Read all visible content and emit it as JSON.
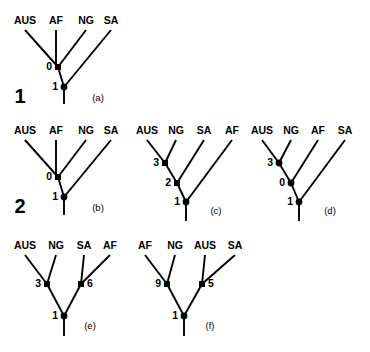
{
  "figure": {
    "background_color": "#ffffff",
    "ink_color": "#000000",
    "width": 370,
    "height": 352,
    "group_numbers": [
      {
        "text": "1",
        "x": 20,
        "y": 98
      },
      {
        "text": "2",
        "x": 20,
        "y": 208
      }
    ]
  },
  "trees": [
    {
      "id": "tree-a",
      "panel_label": "(a)",
      "panel_label_pos": {
        "x": 98,
        "y": 101
      },
      "taxa": [
        {
          "name": "AUS",
          "x": 25,
          "y": 24
        },
        {
          "name": "AF",
          "x": 56,
          "y": 24
        },
        {
          "name": "NG",
          "x": 86,
          "y": 24
        },
        {
          "name": "SA",
          "x": 111,
          "y": 24
        }
      ],
      "nodes": [
        {
          "label": "0",
          "x": 58,
          "y": 67,
          "shape": "square",
          "label_side": "left"
        },
        {
          "label": "1",
          "x": 64,
          "y": 87,
          "shape": "dot",
          "label_side": "left"
        }
      ],
      "branches": [
        [
          25,
          30,
          58,
          67
        ],
        [
          56,
          30,
          56,
          67
        ],
        [
          86,
          30,
          58,
          67
        ],
        [
          111,
          30,
          64,
          87
        ],
        [
          58,
          67,
          64,
          87
        ],
        [
          64,
          87,
          64,
          104
        ]
      ]
    },
    {
      "id": "tree-b",
      "panel_label": "(b)",
      "panel_label_pos": {
        "x": 98,
        "y": 211
      },
      "taxa": [
        {
          "name": "AUS",
          "x": 25,
          "y": 134
        },
        {
          "name": "AF",
          "x": 56,
          "y": 134
        },
        {
          "name": "NG",
          "x": 86,
          "y": 134
        },
        {
          "name": "SA",
          "x": 111,
          "y": 134
        }
      ],
      "nodes": [
        {
          "label": "0",
          "x": 58,
          "y": 177,
          "shape": "square",
          "label_side": "left"
        },
        {
          "label": "1",
          "x": 64,
          "y": 197,
          "shape": "dot",
          "label_side": "left"
        }
      ],
      "branches": [
        [
          25,
          140,
          58,
          177
        ],
        [
          56,
          140,
          56,
          177
        ],
        [
          86,
          140,
          58,
          177
        ],
        [
          111,
          140,
          64,
          197
        ],
        [
          58,
          177,
          64,
          197
        ],
        [
          64,
          197,
          64,
          215
        ]
      ]
    },
    {
      "id": "tree-c",
      "panel_label": "(c)",
      "panel_label_pos": {
        "x": 216,
        "y": 214
      },
      "taxa": [
        {
          "name": "AUS",
          "x": 147,
          "y": 134
        },
        {
          "name": "NG",
          "x": 176,
          "y": 134
        },
        {
          "name": "SA",
          "x": 204,
          "y": 134
        },
        {
          "name": "AF",
          "x": 232,
          "y": 134
        }
      ],
      "nodes": [
        {
          "label": "3",
          "x": 165,
          "y": 163,
          "shape": "square",
          "label_side": "left"
        },
        {
          "label": "2",
          "x": 177,
          "y": 183,
          "shape": "square",
          "label_side": "left"
        },
        {
          "label": "1",
          "x": 186,
          "y": 202,
          "shape": "dot",
          "label_side": "left"
        }
      ],
      "branches": [
        [
          147,
          140,
          165,
          163
        ],
        [
          176,
          140,
          165,
          163
        ],
        [
          204,
          140,
          177,
          183
        ],
        [
          232,
          140,
          186,
          202
        ],
        [
          165,
          163,
          177,
          183
        ],
        [
          177,
          183,
          186,
          202
        ],
        [
          186,
          202,
          186,
          221
        ]
      ]
    },
    {
      "id": "tree-d",
      "panel_label": "(d)",
      "panel_label_pos": {
        "x": 330,
        "y": 214
      },
      "taxa": [
        {
          "name": "AUS",
          "x": 262,
          "y": 134
        },
        {
          "name": "NG",
          "x": 291,
          "y": 134
        },
        {
          "name": "AF",
          "x": 318,
          "y": 134
        },
        {
          "name": "SA",
          "x": 345,
          "y": 134
        }
      ],
      "nodes": [
        {
          "label": "3",
          "x": 279,
          "y": 163,
          "shape": "dot",
          "label_side": "left"
        },
        {
          "label": "0",
          "x": 291,
          "y": 183,
          "shape": "dot",
          "label_side": "left"
        },
        {
          "label": "1",
          "x": 299,
          "y": 202,
          "shape": "dot",
          "label_side": "left"
        }
      ],
      "branches": [
        [
          262,
          140,
          279,
          163
        ],
        [
          291,
          140,
          279,
          163
        ],
        [
          318,
          140,
          291,
          183
        ],
        [
          345,
          140,
          299,
          202
        ],
        [
          279,
          163,
          291,
          183
        ],
        [
          291,
          183,
          299,
          202
        ],
        [
          299,
          202,
          299,
          221
        ]
      ]
    },
    {
      "id": "tree-e",
      "panel_label": "(e)",
      "panel_label_pos": {
        "x": 90,
        "y": 329
      },
      "taxa": [
        {
          "name": "AUS",
          "x": 25,
          "y": 249
        },
        {
          "name": "NG",
          "x": 56,
          "y": 249
        },
        {
          "name": "SA",
          "x": 84,
          "y": 249
        },
        {
          "name": "AF",
          "x": 110,
          "y": 249
        }
      ],
      "nodes": [
        {
          "label": "3",
          "x": 47,
          "y": 284,
          "shape": "square",
          "label_side": "left"
        },
        {
          "label": "6",
          "x": 81,
          "y": 284,
          "shape": "square",
          "label_side": "right"
        },
        {
          "label": "1",
          "x": 64,
          "y": 316,
          "shape": "dot",
          "label_side": "left"
        }
      ],
      "branches": [
        [
          25,
          255,
          47,
          284
        ],
        [
          56,
          255,
          47,
          284
        ],
        [
          84,
          255,
          81,
          284
        ],
        [
          110,
          255,
          81,
          284
        ],
        [
          47,
          284,
          64,
          316
        ],
        [
          81,
          284,
          64,
          316
        ],
        [
          64,
          316,
          64,
          336
        ]
      ]
    },
    {
      "id": "tree-f",
      "panel_label": "(f)",
      "panel_label_pos": {
        "x": 210,
        "y": 329
      },
      "taxa": [
        {
          "name": "AF",
          "x": 145,
          "y": 249
        },
        {
          "name": "NG",
          "x": 175,
          "y": 249
        },
        {
          "name": "AUS",
          "x": 205,
          "y": 249
        },
        {
          "name": "SA",
          "x": 235,
          "y": 249
        }
      ],
      "nodes": [
        {
          "label": "9",
          "x": 167,
          "y": 284,
          "shape": "square",
          "label_side": "left"
        },
        {
          "label": "5",
          "x": 202,
          "y": 284,
          "shape": "square",
          "label_side": "right"
        },
        {
          "label": "1",
          "x": 184,
          "y": 316,
          "shape": "dot",
          "label_side": "left"
        }
      ],
      "branches": [
        [
          145,
          255,
          167,
          284
        ],
        [
          175,
          255,
          167,
          284
        ],
        [
          205,
          255,
          202,
          284
        ],
        [
          235,
          255,
          202,
          284
        ],
        [
          167,
          284,
          184,
          316
        ],
        [
          202,
          284,
          184,
          316
        ],
        [
          184,
          316,
          184,
          336
        ]
      ]
    }
  ]
}
